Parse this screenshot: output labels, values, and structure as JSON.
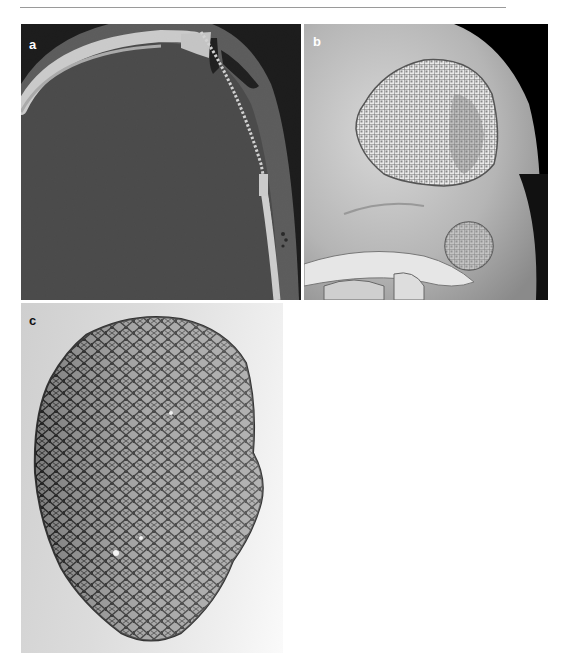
{
  "page": {
    "running_head": "",
    "header_rule": true
  },
  "figure": {
    "panels": [
      {
        "id": "a",
        "label": "a",
        "description": "Axial CT slice (bone window) of skull showing cranial defect covered by mesh implant (dotted bright line) with small air pockets beneath scalp"
      },
      {
        "id": "b",
        "label": "b",
        "description": "3D volume-rendered CT reconstruction of skull, lateral oblique view, showing patterned mesh cranioplasty over frontotemporal defect and orbit"
      },
      {
        "id": "c",
        "label": "c",
        "description": "Photograph of pre-shaped titanium mesh implant with triangular/hexagonal lattice pattern on light gray background"
      }
    ]
  },
  "colors": {
    "ct_background": "#000000",
    "ct_brain": "#3c3c3c",
    "ct_bone": "#e6e6e6",
    "render_bone": "#c8c8c8",
    "photo_background": "#dcdcdc",
    "mesh_dark": "#2a2a2a"
  }
}
